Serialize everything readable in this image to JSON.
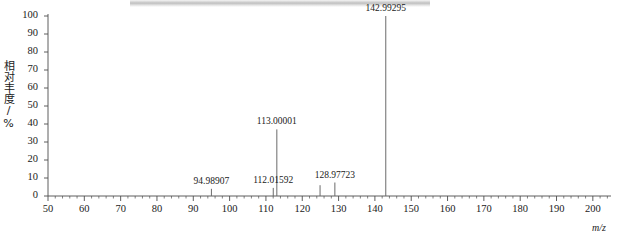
{
  "figure": {
    "kind": "mass-spectrum",
    "artifact_band": "scan-shadow-band"
  },
  "chart_data": {
    "type": "bar",
    "title": "",
    "subtitle": "",
    "xlabel": "m/z",
    "ylabel": "相对丰度/%",
    "xlim": [
      50,
      205
    ],
    "ylim": [
      0,
      100
    ],
    "grid": false,
    "legend": null,
    "x_ticks": [
      50,
      60,
      70,
      80,
      90,
      100,
      110,
      120,
      130,
      140,
      150,
      160,
      170,
      180,
      190,
      200
    ],
    "x_tick_labels": [
      "50",
      "60",
      "70",
      "80",
      "90",
      "100",
      "110",
      "120",
      "130",
      "140",
      "150",
      "160",
      "170",
      "180",
      "190",
      "200"
    ],
    "x_minor_tick_step": 2,
    "y_ticks": [
      0,
      10,
      20,
      30,
      40,
      50,
      60,
      70,
      80,
      90,
      100
    ],
    "y_tick_labels": [
      "0",
      "10",
      "20",
      "30",
      "40",
      "50",
      "60",
      "70",
      "80",
      "90",
      "100"
    ],
    "peaks": [
      {
        "mz": 94.98907,
        "intensity": 4.0,
        "label": "94.98907",
        "labeled": true
      },
      {
        "mz": 112.01592,
        "intensity": 4.5,
        "label": "112.01592",
        "labeled": true
      },
      {
        "mz": 113.00001,
        "intensity": 37.0,
        "label": "113.00001",
        "labeled": true
      },
      {
        "mz": 124.9,
        "intensity": 6.0,
        "label": "",
        "labeled": false
      },
      {
        "mz": 128.97723,
        "intensity": 7.5,
        "label": "128.97723",
        "labeled": true
      },
      {
        "mz": 142.99295,
        "intensity": 100.0,
        "label": "142.99295",
        "labeled": true
      }
    ]
  },
  "axis_titles": {
    "x": "m/z",
    "y": "相对丰度/%"
  }
}
